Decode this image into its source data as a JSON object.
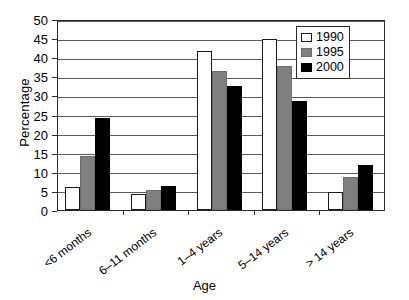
{
  "chart_data": {
    "type": "bar",
    "title": "",
    "xlabel": "Age",
    "ylabel": "Percentage",
    "categories": [
      "<6 months",
      "6–11 months",
      "1–4 years",
      "5–14 years",
      "> 14 years"
    ],
    "series": [
      {
        "name": "1990",
        "color": "#ffffff",
        "values": [
          6.1,
          4.3,
          41.5,
          44.7,
          4.7
        ]
      },
      {
        "name": "1995",
        "color": "#808080",
        "values": [
          14.2,
          5.2,
          36.4,
          37.6,
          8.7
        ]
      },
      {
        "name": "2000",
        "color": "#000000",
        "values": [
          24.2,
          6.3,
          32.4,
          28.6,
          11.9
        ]
      }
    ],
    "ylim": [
      0,
      50
    ],
    "yticks": [
      0,
      5,
      10,
      15,
      20,
      25,
      30,
      35,
      40,
      45,
      50
    ],
    "ytick_labels": [
      "0",
      "5",
      "10",
      "15",
      "20",
      "25",
      "30",
      "35",
      "40",
      "45",
      "50"
    ],
    "grid": true,
    "legend_position": "top-right",
    "legend_entries": [
      "1990",
      "1995",
      "2000"
    ]
  }
}
